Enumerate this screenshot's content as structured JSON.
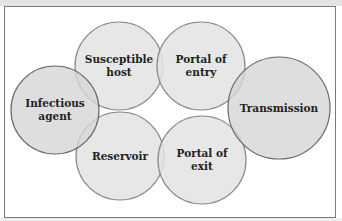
{
  "diagram": {
    "colors": {
      "circle_fill": "#e3e3e3",
      "circle_fill_dark": "#d6d6d6",
      "circle_stroke": "#8a8a8a",
      "circle_stroke_dark": "#6a6a6a",
      "frame_border": "#7a7a7a",
      "text": "#222222"
    },
    "nodes": [
      {
        "id": "susceptible-host",
        "label_lines": [
          "Susceptible",
          "host"
        ],
        "cx": 119,
        "cy": 66,
        "r": 44
      },
      {
        "id": "portal-of-entry",
        "label_lines": [
          "Portal of",
          "entry"
        ],
        "cx": 201,
        "cy": 66,
        "r": 44
      },
      {
        "id": "infectious-agent",
        "label_lines": [
          "Infectious",
          "agent"
        ],
        "cx": 55,
        "cy": 110,
        "r": 44
      },
      {
        "id": "transmission",
        "label_lines": [
          "Transmission"
        ],
        "cx": 279,
        "cy": 108,
        "r": 51
      },
      {
        "id": "reservoir",
        "label_lines": [
          "Reservoir"
        ],
        "cx": 120,
        "cy": 156,
        "r": 44
      },
      {
        "id": "portal-of-exit",
        "label_lines": [
          "Portal of",
          "exit"
        ],
        "cx": 202,
        "cy": 160,
        "r": 44
      }
    ]
  }
}
